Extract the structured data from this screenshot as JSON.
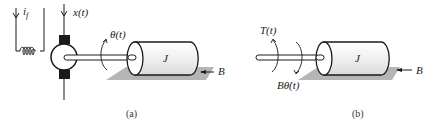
{
  "figure_a": {
    "caption": "(a)",
    "field_current_label": "i",
    "field_current_sub": "f",
    "armature_input_label": "x(t)",
    "angle_label": "θ(t)",
    "inertia_label": "J",
    "damping_label": "B"
  },
  "figure_b": {
    "caption": "(b)",
    "torque_label": "T(t)",
    "damping_torque_label": "Bθ̇(t)",
    "inertia_label": "J",
    "damping_label": "B"
  },
  "colors": {
    "stroke": "#1a1a1a",
    "shadow": "#b5b5b5",
    "cylinder_fill": "#f4f4f4",
    "brush": "#1a1a1a"
  }
}
